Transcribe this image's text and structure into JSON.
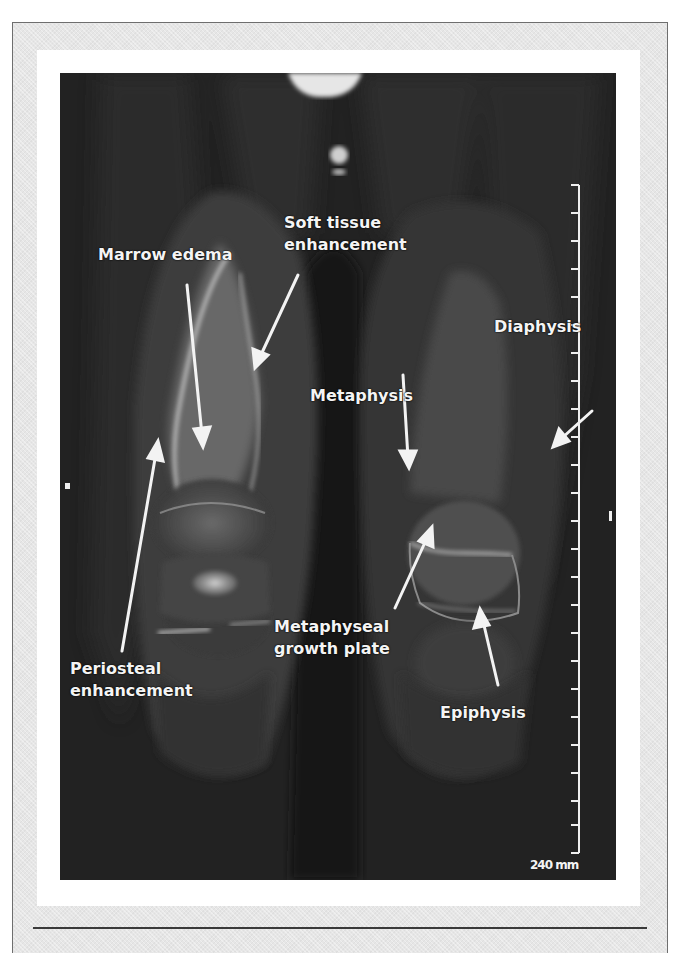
{
  "figure": {
    "type": "coronal MRI of lower limbs (knees/distal femur)",
    "colors": {
      "frame_bg": "#e6e6e6",
      "frame_border": "#6e6e6e",
      "panel_bg": "#ffffff",
      "image_bg": "#232323",
      "annotation_text": "#f4f4f4",
      "divider": "#3a3a3a"
    },
    "annotations": {
      "marrow_edema": "Marrow edema",
      "soft_tissue_line1": "Soft tissue",
      "soft_tissue_line2": "enhancement",
      "diaphysis": "Diaphysis",
      "metaphysis": "Metaphysis",
      "metaphyseal_line1": "Metaphyseal",
      "metaphyseal_line2": "growth plate",
      "periosteal_line1": "Periosteal",
      "periosteal_line2": "enhancement",
      "epiphysis": "Epiphysis"
    },
    "scale": {
      "label": "240 mm",
      "tick_count": 24
    }
  }
}
